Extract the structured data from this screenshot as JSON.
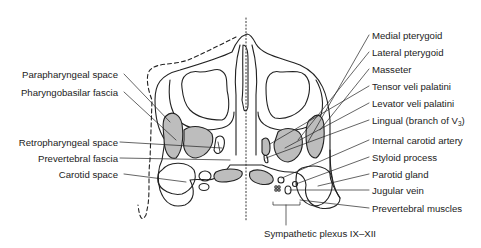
{
  "diagram": {
    "colors": {
      "line": "#222222",
      "fill_muscle": "#bdbdbd",
      "background": "#ffffff"
    },
    "labels_left": [
      {
        "id": "parapharyngeal",
        "text": "Parapharyngeal space"
      },
      {
        "id": "pharyngobasilar",
        "text": "Pharyngobasilar fascia"
      },
      {
        "id": "retropharyngeal",
        "text": "Retropharyngeal space"
      },
      {
        "id": "prevertebral_fascia",
        "text": "Prevertebral fascia"
      },
      {
        "id": "carotid_space",
        "text": "Carotid space"
      }
    ],
    "labels_right": [
      {
        "id": "medial_pterygoid",
        "text": "Medial pterygoid"
      },
      {
        "id": "lateral_pterygoid",
        "text": "Lateral pterygoid"
      },
      {
        "id": "masseter",
        "text": "Masseter"
      },
      {
        "id": "tensor",
        "text": "Tensor veli palatini"
      },
      {
        "id": "levator",
        "text": "Levator veli palatini"
      },
      {
        "id": "lingual",
        "text": "Lingual (branch of V",
        "sub": "3",
        "suffix": ")"
      },
      {
        "id": "ica",
        "text": "Internal carotid artery"
      },
      {
        "id": "styloid",
        "text": "Styloid process"
      },
      {
        "id": "parotid",
        "text": "Parotid gland"
      },
      {
        "id": "jugular",
        "text": "Jugular vein"
      },
      {
        "id": "prevertebral_muscles",
        "text": "Prevertebral muscles"
      }
    ],
    "label_bottom": {
      "id": "sympathetic",
      "text": "Sympathetic plexus IX–XII"
    }
  }
}
